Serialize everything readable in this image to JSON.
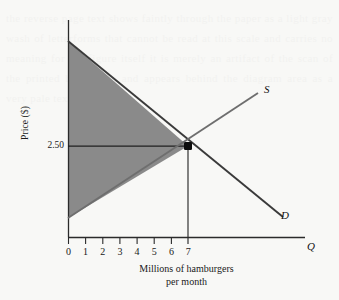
{
  "figure": {
    "kind": "supply-demand-diagram",
    "background_color": "#f8f8f6",
    "ink_color": "#1a1a1a",
    "shade_color": "#8a8a8a"
  },
  "axes": {
    "y_axis_label": "Price ($)",
    "y_axis_letter": "",
    "x_axis_letter": "Q",
    "x_tick_labels": [
      "0",
      "1",
      "2",
      "3",
      "4",
      "5",
      "6",
      "7"
    ],
    "y_tick_labels": [
      "2.50"
    ],
    "grid": false,
    "x_origin_px": 68,
    "x_step_px": 17.15,
    "y_axis_top_px": 20,
    "x_axis_px": 237,
    "x_axis_right_px": 305
  },
  "curves": [
    {
      "name": "Supply",
      "label": "S",
      "label_x": 264,
      "label_y": 89,
      "x1": 68,
      "y1": 218,
      "x2": 258,
      "y2": 93
    },
    {
      "name": "Demand",
      "label": "D",
      "label_x": 281,
      "label_y": 215,
      "x1": 68,
      "y1": 41,
      "x2": 283,
      "y2": 217
    }
  ],
  "equilibrium": {
    "label": "",
    "price": "2.50",
    "quantity": "7",
    "x_px": 188,
    "y_px": 146,
    "marker": "filled-square-dot"
  },
  "shaded_region": {
    "description": "consumer-and-producer-surplus-triangle",
    "points": "68,41 188,146 68,218"
  },
  "caption": {
    "line1": "Millions of hamburgers",
    "line2": "per month"
  },
  "chart_data": {
    "type": "line",
    "title": "",
    "xlabel": "Millions of hamburgers per month",
    "ylabel": "Price ($)",
    "xlim": [
      0,
      13.8
    ],
    "ylim": [
      0,
      5.17
    ],
    "xticks": [
      0,
      1,
      2,
      3,
      4,
      5,
      6,
      7
    ],
    "yticks": [
      2.5
    ],
    "ytick_labels": [
      "2.50"
    ],
    "grid": false,
    "legend_position": "inline-curve-ends",
    "series": [
      {
        "name": "S",
        "legend": "S",
        "x": [
          0,
          7,
          11.08
        ],
        "y": [
          0.452,
          2.5,
          3.43
        ]
      },
      {
        "name": "D",
        "legend": "D",
        "x": [
          0,
          7,
          12.54
        ],
        "y": [
          4.667,
          2.5,
          0.476
        ]
      }
    ],
    "annotations": [
      {
        "text": "",
        "marker": "equilibrium point",
        "x": 7,
        "y": 2.5
      }
    ],
    "shaded_areas": [
      {
        "label": "total surplus",
        "color": "#8a8a8a",
        "vertices": [
          [
            0,
            4.667
          ],
          [
            7,
            2.5
          ],
          [
            0,
            0.452
          ]
        ]
      }
    ]
  }
}
